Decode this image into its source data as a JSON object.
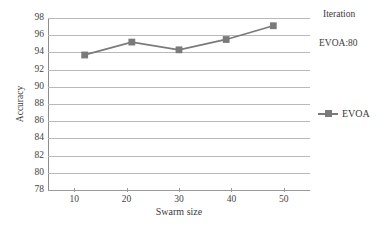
{
  "chart_data": {
    "type": "line",
    "title": "",
    "xlabel": "Swarm size",
    "ylabel": "Accuracy",
    "xlim": [
      5,
      55
    ],
    "ylim": [
      78,
      98
    ],
    "xticks": [
      10,
      20,
      30,
      40,
      50
    ],
    "yticks": [
      78,
      80,
      82,
      84,
      86,
      88,
      90,
      92,
      94,
      96,
      98
    ],
    "grid": true,
    "legend_position": "right",
    "series": [
      {
        "name": "EVOA",
        "color": "#7a7a7a",
        "marker": "square",
        "x": [
          12,
          21,
          30,
          39,
          48
        ],
        "values": [
          93.7,
          95.2,
          94.3,
          95.5,
          97.1
        ]
      }
    ]
  },
  "annotations": {
    "iteration_label": "Iteration",
    "evoa_value_label": "EVOA:80"
  },
  "legend": {
    "entries": [
      {
        "label": "EVOA"
      }
    ]
  },
  "colors": {
    "series": "#7a7a7a",
    "grid": "#b9b9b9",
    "axis": "#8d8d8d",
    "text": "#3a3a3a",
    "background": "#ffffff"
  }
}
